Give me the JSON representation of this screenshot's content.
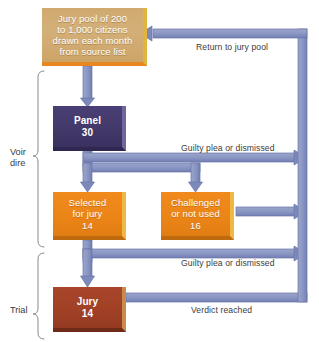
{
  "diagram": {
    "colors": {
      "pool_box": "#d3b079",
      "panel_box": "#433969",
      "orange_box": "#ec8518",
      "jury_box": "#a04126",
      "connector": "#8d99c4",
      "connector_edge": "#6a76a8",
      "background": "#ffffff",
      "text_dark": "#3b3b3b",
      "text_light": "#ffffff"
    },
    "nodes": [
      {
        "id": "pool",
        "name": "jury-pool-box",
        "lines": [
          "Jury pool of 200",
          "to 1,000 citizens",
          "drawn each month",
          "from source list"
        ],
        "count": ""
      },
      {
        "id": "panel",
        "name": "panel-box",
        "lines": [
          "Panel"
        ],
        "count": "30"
      },
      {
        "id": "selected",
        "name": "selected-for-jury-box",
        "lines": [
          "Selected",
          "for jury"
        ],
        "count": "14"
      },
      {
        "id": "challenged",
        "name": "challenged-or-not-used-box",
        "lines": [
          "Challenged",
          "or not used"
        ],
        "count": "16"
      },
      {
        "id": "jury",
        "name": "jury-box",
        "lines": [
          "Jury"
        ],
        "count": "14"
      }
    ],
    "edge_labels": {
      "return_to_pool": "Return to jury pool",
      "guilty_plea_panel": "Guilty plea or dismissed",
      "guilty_plea_selected": "Guilty plea or dismissed",
      "verdict_reached": "Verdict reached"
    },
    "groups": {
      "voir_dire_line1": "Voir",
      "voir_dire_line2": "dire",
      "trial": "Trial"
    }
  }
}
